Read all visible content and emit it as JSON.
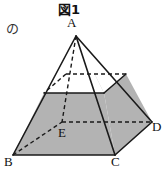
{
  "figure": {
    "title": "図1",
    "side_annotation": "の",
    "description_type": "geometry-diagram",
    "shape": "square-pyramid-with-shaded-frustum",
    "fill_color": "#b3b3b3",
    "line_color": "#1a1a1a",
    "background_color": "#ffffff",
    "vertices": [
      {
        "id": "A",
        "label": "A",
        "role": "apex",
        "x": 76,
        "y": 36
      },
      {
        "id": "B",
        "label": "B",
        "role": "base-corner",
        "x": 13,
        "y": 155
      },
      {
        "id": "C",
        "label": "C",
        "role": "base-corner",
        "x": 115,
        "y": 155
      },
      {
        "id": "D",
        "label": "D",
        "role": "base-corner",
        "x": 152,
        "y": 122
      },
      {
        "id": "E",
        "label": "E",
        "role": "base-corner",
        "x": 62,
        "y": 122
      }
    ],
    "cut_plane_vertices": [
      {
        "id": "P",
        "role": "cut-front-left",
        "x": 44,
        "y": 93
      },
      {
        "id": "Q",
        "role": "cut-front-right",
        "x": 104,
        "y": 93
      },
      {
        "id": "R",
        "role": "cut-back-right",
        "x": 126,
        "y": 74
      },
      {
        "id": "S",
        "role": "cut-back-left",
        "x": 66,
        "y": 74
      }
    ],
    "edges": [
      {
        "from": "A",
        "to": "B",
        "style": "solid"
      },
      {
        "from": "A",
        "to": "C",
        "style": "solid"
      },
      {
        "from": "A",
        "to": "D",
        "style": "solid"
      },
      {
        "from": "A",
        "to": "E",
        "style": "dashed"
      },
      {
        "from": "B",
        "to": "C",
        "style": "solid"
      },
      {
        "from": "C",
        "to": "D",
        "style": "solid"
      },
      {
        "from": "B",
        "to": "E",
        "style": "dashed"
      },
      {
        "from": "E",
        "to": "D",
        "style": "dashed"
      }
    ],
    "cut_edges": [
      {
        "from": "P",
        "to": "Q",
        "style": "solid"
      },
      {
        "from": "Q",
        "to": "R",
        "style": "solid"
      },
      {
        "from": "R",
        "to": "S",
        "style": "dashed"
      },
      {
        "from": "S",
        "to": "P",
        "style": "dashed"
      }
    ]
  }
}
